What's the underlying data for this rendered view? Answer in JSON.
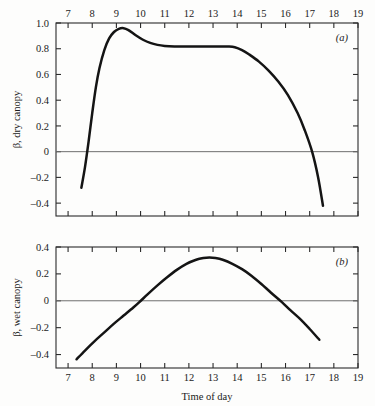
{
  "figure": {
    "background_color": "#fdfdfc",
    "curve_color": "#141414",
    "axis_color": "#2b2b2b",
    "zero_line_color": "#6f6f6f"
  },
  "chart_data": [
    {
      "type": "line",
      "panel_tag": "(a)",
      "title": "",
      "xlabel": "",
      "ylabel": "β, dry canopy",
      "xlim": [
        6.5,
        19.0
      ],
      "ylim": [
        -0.5,
        1.0
      ],
      "grid": false,
      "legend": "none",
      "x_axis_position": "top",
      "xticks": [
        7,
        8,
        9,
        10,
        11,
        12,
        13,
        14,
        15,
        16,
        17,
        18,
        19
      ],
      "xticklabels": [
        "7",
        "8",
        "9",
        "10",
        "11",
        "12",
        "13",
        "14",
        "15",
        "16",
        "17",
        "18",
        "19"
      ],
      "yticks": [
        1.0,
        0.8,
        0.6,
        0.4,
        0.2,
        0.0,
        -0.2,
        -0.4
      ],
      "yticklabels": [
        "1.0",
        "0.8",
        "0.6",
        "0.4",
        "0.2",
        "0",
        "–0.2",
        "–0.4"
      ],
      "zero_line": 0.0,
      "x": [
        7.55,
        7.7,
        7.85,
        8.0,
        8.15,
        8.3,
        8.5,
        8.7,
        8.9,
        9.1,
        9.3,
        9.5,
        9.8,
        10.1,
        10.4,
        10.7,
        11.0,
        11.4,
        11.8,
        12.2,
        12.6,
        13.0,
        13.3,
        13.6,
        13.9,
        14.2,
        14.5,
        14.9,
        15.3,
        15.7,
        16.1,
        16.5,
        16.8,
        17.1,
        17.35,
        17.55
      ],
      "values": [
        -0.28,
        -0.12,
        0.08,
        0.3,
        0.5,
        0.65,
        0.79,
        0.88,
        0.93,
        0.955,
        0.96,
        0.945,
        0.905,
        0.87,
        0.845,
        0.83,
        0.822,
        0.818,
        0.818,
        0.818,
        0.818,
        0.818,
        0.818,
        0.817,
        0.812,
        0.79,
        0.755,
        0.7,
        0.63,
        0.545,
        0.44,
        0.3,
        0.165,
        0.0,
        -0.2,
        -0.42
      ]
    },
    {
      "type": "line",
      "panel_tag": "(b)",
      "title": "",
      "xlabel": "Time of day",
      "ylabel": "β, wet canopy",
      "xlim": [
        6.5,
        19.0
      ],
      "ylim": [
        -0.5,
        0.4
      ],
      "grid": false,
      "legend": "none",
      "x_axis_position": "bottom",
      "xticks": [
        7,
        8,
        9,
        10,
        11,
        12,
        13,
        14,
        15,
        16,
        17,
        18,
        19
      ],
      "xticklabels": [
        "7",
        "8",
        "9",
        "10",
        "11",
        "12",
        "13",
        "14",
        "15",
        "16",
        "17",
        "18",
        "19"
      ],
      "yticks": [
        0.4,
        0.2,
        0.0,
        -0.2,
        -0.4
      ],
      "yticklabels": [
        "0.4",
        "0.2",
        "0",
        "–0.2",
        "–0.4"
      ],
      "zero_line": 0.0,
      "x": [
        7.35,
        7.7,
        8.1,
        8.5,
        8.9,
        9.3,
        9.7,
        9.95,
        10.3,
        10.7,
        11.1,
        11.5,
        11.9,
        12.3,
        12.6,
        12.85,
        13.1,
        13.4,
        13.8,
        14.2,
        14.6,
        15.0,
        15.4,
        15.85,
        16.2,
        16.6,
        17.0,
        17.4
      ],
      "values": [
        -0.435,
        -0.37,
        -0.3,
        -0.235,
        -0.17,
        -0.11,
        -0.05,
        -0.01,
        0.05,
        0.115,
        0.175,
        0.23,
        0.275,
        0.305,
        0.318,
        0.322,
        0.318,
        0.305,
        0.275,
        0.235,
        0.185,
        0.125,
        0.06,
        -0.01,
        -0.07,
        -0.135,
        -0.21,
        -0.29
      ]
    }
  ]
}
